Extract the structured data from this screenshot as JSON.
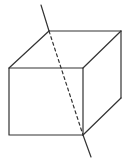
{
  "diagram": {
    "title": "Cube with a line passing through it",
    "stroke_color": "#333333",
    "background": "#ffffff",
    "cube": {
      "front_face": {
        "top_left": [
          9,
          68
        ],
        "top_right": [
          83,
          68
        ],
        "bottom_right": [
          83,
          135
        ],
        "bottom_left": [
          9,
          135
        ]
      },
      "back_vertices": {
        "top_left": [
          49,
          31
        ],
        "top_right": [
          121,
          31
        ],
        "bottom_right": [
          121,
          98
        ]
      }
    },
    "line": {
      "outer_top": {
        "from": [
          41,
          5
        ],
        "to": [
          49,
          31
        ]
      },
      "hidden_dashed": {
        "from": [
          49,
          31
        ],
        "to": [
          83,
          135
        ]
      },
      "outer_bottom": {
        "from": [
          83,
          135
        ],
        "to": [
          91,
          157
        ]
      }
    }
  }
}
